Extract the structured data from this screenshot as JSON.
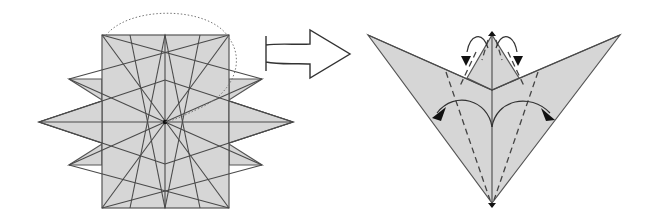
{
  "diagram": {
    "type": "origami-folding-instruction",
    "steps": [
      {
        "id": "step-before",
        "description": "12-point star crease pattern: square base with overlapping rotated square and diamond points, crease lines radiating from center; dotted arc indicates fold over top",
        "fill_color": "#d6d6d6",
        "stroke_color": "#555555"
      },
      {
        "id": "step-transition",
        "description": "Hollow right-pointing arrow indicating next step"
      },
      {
        "id": "step-after",
        "description": "Folded V / bird-base shape with valley-fold dashed lines and curved arrows indicating petal folds outward",
        "fill_color": "#d6d6d6",
        "stroke_color": "#555555"
      }
    ],
    "colors": {
      "paper": "#d6d6d6",
      "line": "#4a4a4a",
      "arrowhead": "#111111",
      "background": "#ffffff"
    }
  }
}
